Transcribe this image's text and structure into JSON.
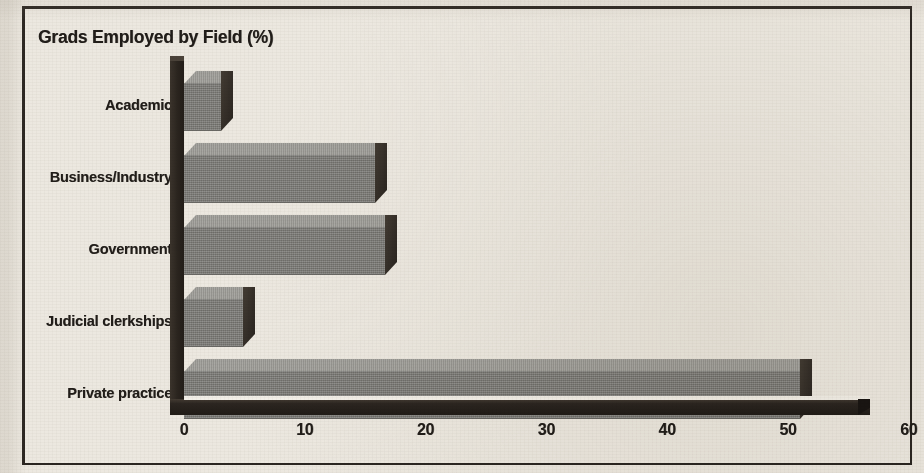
{
  "figure": {
    "title": "Grads Employed by Field (%)",
    "frame_color": "#2b2621",
    "paper_color": "#ece8e0",
    "bar_front_color": "#7c7b77",
    "bar_top_color": "#9d9c97",
    "bar_side_color": "#332d27",
    "axis_color": "#2b2520",
    "text_color": "#211d19"
  },
  "chart_data": {
    "type": "bar",
    "orientation": "horizontal",
    "style": "3d-extruded",
    "title": "Grads Employed by Field (%)",
    "xlabel": "",
    "ylabel": "",
    "xlim": [
      0,
      60
    ],
    "grid": false,
    "legend": false,
    "xticks": [
      0,
      10,
      20,
      30,
      40,
      50,
      60
    ],
    "xtick_labels": [
      "0",
      "10",
      "20",
      "30",
      "40",
      "50",
      "60"
    ],
    "categories": [
      "Academic",
      "Business/Industry",
      "Government",
      "Judicial clerkships",
      "Private practice"
    ],
    "values": [
      3.1,
      15.8,
      16.6,
      4.9,
      51.0
    ],
    "units": "%",
    "bars": [
      {
        "label": "Academic",
        "value": 3.1
      },
      {
        "label": "Business/Industry",
        "value": 15.8
      },
      {
        "label": "Government",
        "value": 16.6
      },
      {
        "label": "Judicial clerkships",
        "value": 4.9
      },
      {
        "label": "Private practice",
        "value": 51.0
      }
    ]
  }
}
